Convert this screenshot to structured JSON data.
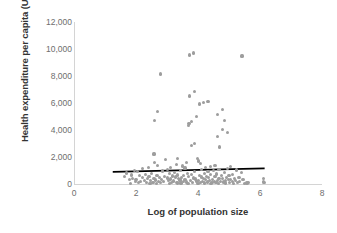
{
  "chart_data": {
    "type": "scatter",
    "title": "",
    "xlabel": "Log of population size",
    "ylabel": "Health expenditure per capita (US$)",
    "xlim": [
      0,
      8
    ],
    "ylim": [
      0,
      12000
    ],
    "xticks": [
      "0",
      "2",
      "4",
      "6",
      "8"
    ],
    "xtick_values": [
      0,
      2,
      4,
      6,
      8
    ],
    "yticks": [
      "0",
      "2,000",
      "4,000",
      "6,000",
      "8,000",
      "10,000",
      "12,000"
    ],
    "ytick_values": [
      0,
      2000,
      4000,
      6000,
      8000,
      10000,
      12000
    ],
    "grid": false,
    "legend": null,
    "marker_color": "#9d9d9d",
    "trendline_color": "#000000",
    "axis_color": "#d4d4d4",
    "tick_label_color": "#6e6e6e",
    "series": [
      {
        "name": "Countries",
        "points": [
          [
            3.72,
            9550
          ],
          [
            3.85,
            9700
          ],
          [
            5.42,
            9480
          ],
          [
            2.78,
            8150
          ],
          [
            3.9,
            6870
          ],
          [
            3.72,
            6520
          ],
          [
            4.32,
            6130
          ],
          [
            4.06,
            5930
          ],
          [
            4.18,
            6030
          ],
          [
            4.78,
            5500
          ],
          [
            2.7,
            5350
          ],
          [
            4.64,
            5130
          ],
          [
            3.95,
            4980
          ],
          [
            4.85,
            4700
          ],
          [
            3.78,
            4620
          ],
          [
            3.71,
            4500
          ],
          [
            2.6,
            4710
          ],
          [
            3.7,
            4330
          ],
          [
            4.78,
            4030
          ],
          [
            4.95,
            3800
          ],
          [
            4.62,
            3530
          ],
          [
            3.9,
            2980
          ],
          [
            4.7,
            2740
          ],
          [
            3.8,
            2880
          ],
          [
            2.58,
            2220
          ],
          [
            3.98,
            1900
          ],
          [
            3.35,
            1880
          ],
          [
            2.95,
            1790
          ],
          [
            4.02,
            1700
          ],
          [
            3.62,
            1600
          ],
          [
            2.6,
            1570
          ],
          [
            4.08,
            1530
          ],
          [
            3.3,
            1450
          ],
          [
            4.55,
            1400
          ],
          [
            2.7,
            1390
          ],
          [
            3.5,
            1340
          ],
          [
            4.4,
            1300
          ],
          [
            5.05,
            1280
          ],
          [
            3.12,
            1250
          ],
          [
            4.25,
            1230
          ],
          [
            2.4,
            1200
          ],
          [
            3.58,
            1180
          ],
          [
            4.95,
            1150
          ],
          [
            2.22,
            1120
          ],
          [
            3.02,
            1100
          ],
          [
            4.12,
            1090
          ],
          [
            4.68,
            1060
          ],
          [
            5.25,
            1040
          ],
          [
            1.95,
            1020
          ],
          [
            3.44,
            1000
          ],
          [
            4.5,
            980
          ],
          [
            2.85,
            960
          ],
          [
            3.88,
            940
          ],
          [
            4.32,
            920
          ],
          [
            2.05,
            900
          ],
          [
            3.25,
            880
          ],
          [
            4.85,
            860
          ],
          [
            5.4,
            840
          ],
          [
            1.7,
            820
          ],
          [
            3.65,
            800
          ],
          [
            4.2,
            790
          ],
          [
            2.5,
            770
          ],
          [
            3.08,
            750
          ],
          [
            4.6,
            740
          ],
          [
            5.1,
            720
          ],
          [
            2.3,
            700
          ],
          [
            3.78,
            690
          ],
          [
            4.4,
            680
          ],
          [
            1.85,
            670
          ],
          [
            3.35,
            660
          ],
          [
            4.05,
            650
          ],
          [
            2.68,
            640
          ],
          [
            3.52,
            630
          ],
          [
            4.75,
            620
          ],
          [
            5.0,
            610
          ],
          [
            2.12,
            600
          ],
          [
            3.18,
            590
          ],
          [
            4.28,
            580
          ],
          [
            2.92,
            570
          ],
          [
            3.7,
            560
          ],
          [
            4.55,
            550
          ],
          [
            1.62,
            545
          ],
          [
            2.42,
            535
          ],
          [
            3.28,
            525
          ],
          [
            4.1,
            515
          ],
          [
            4.92,
            505
          ],
          [
            5.32,
            495
          ],
          [
            2.75,
            485
          ],
          [
            3.48,
            475
          ],
          [
            4.35,
            470
          ],
          [
            2.2,
            460
          ],
          [
            3.02,
            450
          ],
          [
            3.85,
            445
          ],
          [
            4.68,
            435
          ],
          [
            5.18,
            425
          ],
          [
            1.9,
            420
          ],
          [
            2.58,
            410
          ],
          [
            3.38,
            405
          ],
          [
            4.18,
            395
          ],
          [
            4.8,
            390
          ],
          [
            2.38,
            380
          ],
          [
            3.12,
            375
          ],
          [
            3.92,
            365
          ],
          [
            4.48,
            360
          ],
          [
            5.05,
            350
          ],
          [
            2.0,
            345
          ],
          [
            2.82,
            340
          ],
          [
            3.58,
            330
          ],
          [
            4.25,
            325
          ],
          [
            4.98,
            315
          ],
          [
            5.45,
            310
          ],
          [
            1.78,
            305
          ],
          [
            2.62,
            300
          ],
          [
            3.42,
            290
          ],
          [
            4.02,
            285
          ],
          [
            4.62,
            278
          ],
          [
            5.22,
            270
          ],
          [
            2.28,
            265
          ],
          [
            3.05,
            258
          ],
          [
            3.75,
            250
          ],
          [
            4.38,
            245
          ],
          [
            4.88,
            238
          ],
          [
            2.48,
            230
          ],
          [
            3.22,
            225
          ],
          [
            3.95,
            218
          ],
          [
            4.52,
            212
          ],
          [
            5.12,
            205
          ],
          [
            1.98,
            200
          ],
          [
            2.72,
            195
          ],
          [
            3.52,
            188
          ],
          [
            4.15,
            182
          ],
          [
            4.72,
            175
          ],
          [
            5.35,
            170
          ],
          [
            2.15,
            165
          ],
          [
            2.9,
            158
          ],
          [
            3.62,
            152
          ],
          [
            4.3,
            148
          ],
          [
            4.82,
            142
          ],
          [
            2.35,
            138
          ],
          [
            3.15,
            132
          ],
          [
            3.82,
            128
          ],
          [
            4.45,
            122
          ],
          [
            5.02,
            118
          ],
          [
            2.55,
            112
          ],
          [
            3.32,
            108
          ],
          [
            4.08,
            102
          ],
          [
            4.58,
            98
          ],
          [
            5.28,
            92
          ],
          [
            2.08,
            88
          ],
          [
            2.78,
            82
          ],
          [
            3.45,
            78
          ],
          [
            4.22,
            72
          ],
          [
            4.9,
            68
          ],
          [
            1.82,
            62
          ],
          [
            2.65,
            58
          ],
          [
            3.35,
            55
          ],
          [
            4.0,
            50
          ],
          [
            4.65,
            45
          ],
          [
            5.5,
            45
          ],
          [
            2.45,
            40
          ],
          [
            3.08,
            38
          ],
          [
            3.68,
            32
          ],
          [
            4.42,
            30
          ],
          [
            5.15,
            28
          ],
          [
            6.12,
            410
          ],
          [
            6.1,
            170
          ],
          [
            6.13,
            120
          ],
          [
            5.58,
            70
          ],
          [
            5.62,
            130
          ]
        ]
      }
    ],
    "trendline": {
      "name": "Linear fit",
      "x_start": 1.25,
      "y_start": 900,
      "x_end": 6.15,
      "y_end": 1160
    }
  }
}
